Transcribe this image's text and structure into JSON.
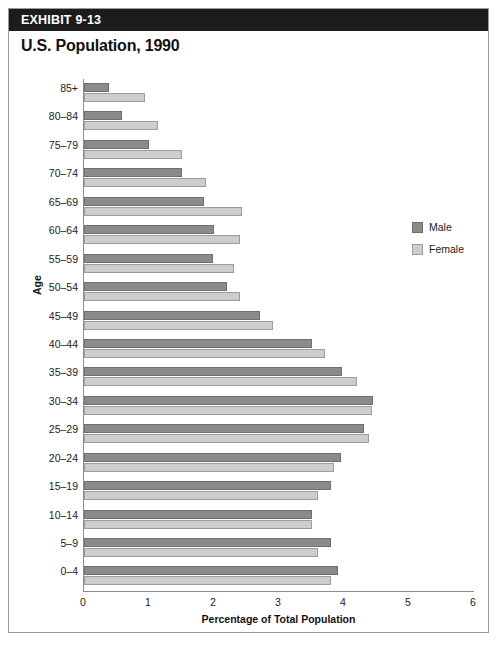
{
  "exhibit": {
    "label": "EXHIBIT 9-13",
    "title": "U.S. Population, 1990"
  },
  "legend": {
    "male_label": "Male",
    "female_label": "Female",
    "male_color": "#8b8b8b",
    "female_color": "#cdcdcd"
  },
  "chart_data": {
    "type": "bar",
    "orientation": "horizontal",
    "title": "U.S. Population, 1990",
    "xlabel": "Percentage of Total Population",
    "ylabel": "Age",
    "xlim": [
      0,
      6
    ],
    "xticks": [
      0,
      1,
      2,
      3,
      4,
      5,
      6
    ],
    "xtick_labels": [
      "0",
      "1",
      "2",
      "3",
      "4",
      "5",
      "6"
    ],
    "grid": false,
    "legend_position": "right",
    "categories": [
      "85+",
      "80–84",
      "75–79",
      "70–74",
      "65–69",
      "60–64",
      "55–59",
      "50–54",
      "45–49",
      "40–44",
      "35–39",
      "30–34",
      "25–29",
      "20–24",
      "15–19",
      "10–14",
      "5–9",
      "0–4"
    ],
    "series": [
      {
        "name": "Male",
        "color": "#8b8b8b",
        "values": [
          0.38,
          0.58,
          1.0,
          1.5,
          1.85,
          2.0,
          1.98,
          2.2,
          2.7,
          3.5,
          3.97,
          4.45,
          4.3,
          3.95,
          3.8,
          3.5,
          3.8,
          3.9
        ]
      },
      {
        "name": "Female",
        "color": "#cdcdcd",
        "values": [
          0.94,
          1.14,
          1.5,
          1.88,
          2.43,
          2.4,
          2.3,
          2.4,
          2.9,
          3.7,
          4.2,
          4.43,
          4.38,
          3.85,
          3.6,
          3.5,
          3.6,
          3.8
        ]
      }
    ]
  }
}
